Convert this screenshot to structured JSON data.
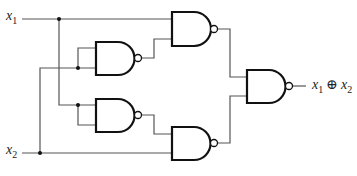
{
  "diagram": {
    "type": "logic-circuit",
    "inputs": [
      {
        "id": "x1",
        "var": "x",
        "sub": "1"
      },
      {
        "id": "x2",
        "var": "x",
        "sub": "2"
      }
    ],
    "output": {
      "left_var": "x",
      "left_sub": "1",
      "operator": "⊕",
      "right_var": "x",
      "right_sub": "2"
    },
    "gates": [
      {
        "id": "G1",
        "kind": "NAND",
        "inputs": [
          "x1",
          "G2"
        ]
      },
      {
        "id": "G2",
        "kind": "NAND",
        "inputs": [
          "x2",
          "x2"
        ]
      },
      {
        "id": "G3",
        "kind": "NAND",
        "inputs": [
          "x1",
          "x1"
        ]
      },
      {
        "id": "G4",
        "kind": "NAND",
        "inputs": [
          "G3",
          "x2"
        ]
      },
      {
        "id": "G5",
        "kind": "NAND",
        "inputs": [
          "G1",
          "G4"
        ]
      }
    ],
    "colors": {
      "wire": "#555555",
      "gate": "#111111",
      "background": "#ffffff"
    }
  }
}
